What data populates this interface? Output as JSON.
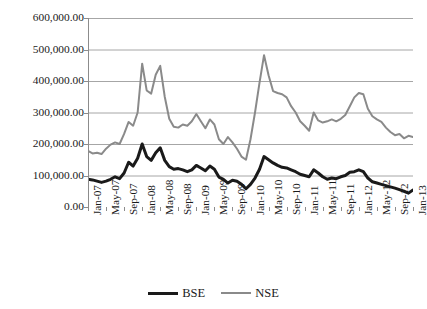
{
  "title_remnant": "                                                                          ",
  "legend": {
    "position": "bottom-center",
    "items": [
      {
        "label": "BSE",
        "color": "#1a1a1a",
        "width": 3
      },
      {
        "label": "NSE",
        "color": "#8a8a8a",
        "width": 2
      }
    ]
  },
  "axes": {
    "y_tick_labels": [
      "600,000.00",
      "500,000.00",
      "400,000.00",
      "300,000.00",
      "200,000.00",
      "100,000.00",
      "0.00"
    ],
    "x_tick_labels": [
      "Jan-07",
      "May-07",
      "Sep-07",
      "Jan-08",
      "May-08",
      "Sep-08",
      "Jan-09",
      "May-09",
      "Sep-09",
      "Jan-10",
      "May-10",
      "Sep-10",
      "Jan-11",
      "May-11",
      "Sep-11",
      "Jan-12",
      "May-12",
      "Sep-12",
      "Jan-13"
    ],
    "gridline_color": "#a6a6a6",
    "axis_color": "#8c8c8c"
  },
  "chart_data": {
    "type": "line",
    "title": "",
    "subtitle": "",
    "xlabel": "",
    "ylabel": "",
    "ylim": [
      0,
      600000
    ],
    "ytick_interval": 100000,
    "grid": "horizontal",
    "legend_position": "bottom-center",
    "x_tick_labels": [
      "Jan-07",
      "May-07",
      "Sep-07",
      "Jan-08",
      "May-08",
      "Sep-08",
      "Jan-09",
      "May-09",
      "Sep-09",
      "Jan-10",
      "May-10",
      "Sep-10",
      "Jan-11",
      "May-11",
      "Sep-11",
      "Jan-12",
      "May-12",
      "Sep-12",
      "Jan-13"
    ],
    "x_tick_interval_months": 4,
    "x": [
      "Jan-07",
      "Feb-07",
      "Mar-07",
      "Apr-07",
      "May-07",
      "Jun-07",
      "Jul-07",
      "Aug-07",
      "Sep-07",
      "Oct-07",
      "Nov-07",
      "Dec-07",
      "Jan-08",
      "Feb-08",
      "Mar-08",
      "Apr-08",
      "May-08",
      "Jun-08",
      "Jul-08",
      "Aug-08",
      "Sep-08",
      "Oct-08",
      "Nov-08",
      "Dec-08",
      "Jan-09",
      "Feb-09",
      "Mar-09",
      "Apr-09",
      "May-09",
      "Jun-09",
      "Jul-09",
      "Aug-09",
      "Sep-09",
      "Oct-09",
      "Nov-09",
      "Dec-09",
      "Jan-10",
      "Feb-10",
      "Mar-10",
      "Apr-10",
      "May-10",
      "Jun-10",
      "Jul-10",
      "Aug-10",
      "Sep-10",
      "Oct-10",
      "Nov-10",
      "Dec-10",
      "Jan-11",
      "Feb-11",
      "Mar-11",
      "Apr-11",
      "May-11",
      "Jun-11",
      "Jul-11",
      "Aug-11",
      "Sep-11",
      "Oct-11",
      "Nov-11",
      "Dec-11",
      "Jan-12",
      "Feb-12",
      "Mar-12",
      "Apr-12",
      "May-12",
      "Jun-12",
      "Jul-12",
      "Aug-12",
      "Sep-12",
      "Oct-12",
      "Nov-12",
      "Dec-12",
      "Jan-13"
    ],
    "series": [
      {
        "name": "BSE",
        "color": "#1a1a1a",
        "line_width": 3,
        "values": [
          88000,
          86000,
          82000,
          78000,
          82000,
          88000,
          96000,
          90000,
          108000,
          142000,
          130000,
          155000,
          200000,
          160000,
          148000,
          172000,
          188000,
          148000,
          128000,
          120000,
          122000,
          118000,
          112000,
          118000,
          132000,
          124000,
          115000,
          130000,
          120000,
          95000,
          88000,
          76000,
          85000,
          82000,
          72000,
          58000,
          72000,
          92000,
          120000,
          160000,
          150000,
          140000,
          132000,
          126000,
          124000,
          118000,
          112000,
          104000,
          100000,
          96000,
          118000,
          108000,
          96000,
          88000,
          92000,
          90000,
          96000,
          100000,
          110000,
          112000,
          118000,
          112000,
          92000,
          80000,
          76000,
          72000,
          68000,
          64000,
          60000,
          55000,
          50000,
          44000,
          54000
        ]
      },
      {
        "name": "NSE",
        "color": "#8a8a8a",
        "line_width": 2,
        "values": [
          178000,
          170000,
          172000,
          168000,
          185000,
          198000,
          205000,
          200000,
          232000,
          270000,
          258000,
          300000,
          455000,
          370000,
          360000,
          420000,
          448000,
          350000,
          280000,
          255000,
          252000,
          262000,
          258000,
          272000,
          295000,
          272000,
          250000,
          278000,
          262000,
          215000,
          200000,
          222000,
          205000,
          185000,
          160000,
          150000,
          215000,
          300000,
          395000,
          482000,
          418000,
          368000,
          362000,
          358000,
          348000,
          320000,
          300000,
          272000,
          258000,
          242000,
          300000,
          275000,
          268000,
          272000,
          278000,
          272000,
          280000,
          292000,
          320000,
          348000,
          362000,
          358000,
          312000,
          288000,
          278000,
          270000,
          252000,
          238000,
          228000,
          232000,
          218000,
          226000,
          222000
        ]
      }
    ],
    "annotations": [
      {
        "text": "NSE peak ~482,000 at Apr-10 region",
        "visible": false
      }
    ]
  }
}
